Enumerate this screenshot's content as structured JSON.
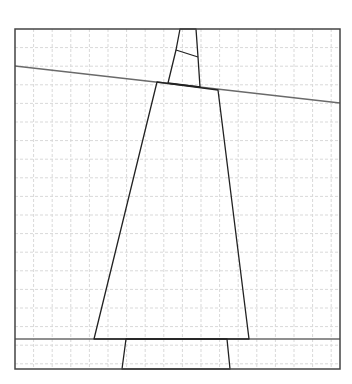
{
  "diagram": {
    "kind": "geometric line drawing on dashed grid",
    "frame": {
      "x1": 15,
      "y1": 29,
      "x2": 340,
      "y2": 369
    },
    "grid": {
      "spacing": 18.6,
      "color": "#d9d9d9",
      "dash": "3,2"
    },
    "stroke": {
      "main": "#222222",
      "secondary": "#6a6a6a"
    },
    "lines": [
      {
        "name": "tilted-horizontal-line",
        "x1": 15,
        "y1": 66,
        "x2": 340,
        "y2": 103,
        "color": "#6a6a6a"
      },
      {
        "name": "bottom-horizontal-line",
        "x1": 15,
        "y1": 339,
        "x2": 340,
        "y2": 339,
        "color": "#6a6a6a"
      }
    ],
    "polygons": [
      {
        "name": "upper-narrow-piece",
        "points": "180,29 196,29 198,57 200,87 168,83 176,50"
      },
      {
        "name": "upper-piece-divider",
        "points": "176,50 198,57",
        "open": true
      },
      {
        "name": "main-trapezoid",
        "points": "157,82 218,90 249,339 94,339"
      },
      {
        "name": "bottom-piece",
        "points": "126,339 227,339 230,369 122,369"
      }
    ]
  }
}
